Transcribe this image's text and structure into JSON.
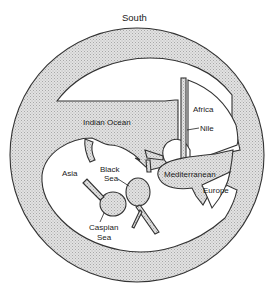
{
  "diagram": {
    "type": "circular world map (T-O style, south at top)",
    "orientation_label": "South",
    "colors": {
      "sea": "#d9d9d9",
      "land": "#ffffff",
      "outline": "#333333",
      "text": "#1a1a1a"
    },
    "labels": {
      "south": "South",
      "indian_ocean": "Indian Ocean",
      "africa": "Africa",
      "nile": "Nile",
      "asia": "Asia",
      "black_sea_1": "Black",
      "black_sea_2": "Sea",
      "mediterranean": "Mediterranean",
      "europe": "Europe",
      "caspian_sea_1": "Caspian",
      "caspian_sea_2": "Sea"
    },
    "regions": [
      {
        "name": "Outer Ocean",
        "kind": "sea"
      },
      {
        "name": "Indian Ocean",
        "kind": "sea"
      },
      {
        "name": "Africa",
        "kind": "land"
      },
      {
        "name": "Nile",
        "kind": "river"
      },
      {
        "name": "Asia",
        "kind": "land"
      },
      {
        "name": "Black Sea",
        "kind": "sea"
      },
      {
        "name": "Caspian Sea",
        "kind": "sea"
      },
      {
        "name": "Mediterranean",
        "kind": "sea"
      },
      {
        "name": "Europe",
        "kind": "land"
      }
    ]
  }
}
